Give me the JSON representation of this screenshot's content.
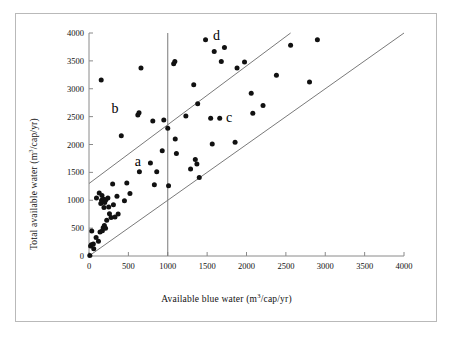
{
  "figure": {
    "background": "#ffffff",
    "frame_color": "#b9b9b9",
    "point_color": "#111111",
    "line_color": "#7a7a7a",
    "axis_color": "#8a8a8a"
  },
  "chart_data": {
    "type": "scatter",
    "title": "",
    "xlabel": "Available blue water (m3/cap/yr)",
    "ylabel": "Total available water (m3/cap/yr)",
    "xlabel_main": "Available blue water (m",
    "xlabel_sup": "3",
    "xlabel_tail": "/cap/yr)",
    "ylabel_main": "Total available water (m",
    "ylabel_sup": "3",
    "ylabel_tail": "/cap/yr)",
    "xlim": [
      0,
      4000
    ],
    "ylim": [
      0,
      4000
    ],
    "xticks": [
      0,
      500,
      1000,
      1500,
      2000,
      2500,
      3000,
      3500,
      4000
    ],
    "yticks": [
      0,
      500,
      1000,
      1500,
      2000,
      2500,
      3000,
      3500,
      4000
    ],
    "xtick_labels": [
      "0",
      "500",
      "1000",
      "1500",
      "2000",
      "2500",
      "3000",
      "3500",
      "4000"
    ],
    "ytick_labels": [
      "0",
      "500",
      "1000",
      "1500",
      "2000",
      "2500",
      "3000",
      "3500",
      "4000"
    ],
    "grid": false,
    "legend": "none",
    "marker": "filled-circle",
    "marker_size_px": 5,
    "reference_lines": [
      {
        "name": "vertical-threshold-1000",
        "type": "vertical",
        "x": 1000,
        "y_from": 0,
        "y_to": 4000
      },
      {
        "name": "upper-diagonal",
        "type": "line",
        "x_from": 0,
        "y_from": 1300,
        "x_to": 2560,
        "y_to": 4000
      },
      {
        "name": "lower-diagonal",
        "type": "line",
        "x_from": 0,
        "y_from": 0,
        "x_to": 4000,
        "y_to": 4000
      }
    ],
    "annotations": [
      {
        "label": "a",
        "x": 620,
        "y": 1680
      },
      {
        "label": "b",
        "x": 330,
        "y": 2640
      },
      {
        "label": "c",
        "x": 1780,
        "y": 2470
      },
      {
        "label": "d",
        "x": 1620,
        "y": 3950
      }
    ],
    "points": [
      {
        "x": 10,
        "y": 10
      },
      {
        "x": 20,
        "y": 180
      },
      {
        "x": 30,
        "y": 200
      },
      {
        "x": 35,
        "y": 450
      },
      {
        "x": 55,
        "y": 215
      },
      {
        "x": 60,
        "y": 130
      },
      {
        "x": 90,
        "y": 330
      },
      {
        "x": 95,
        "y": 1040
      },
      {
        "x": 120,
        "y": 265
      },
      {
        "x": 130,
        "y": 1130
      },
      {
        "x": 140,
        "y": 430
      },
      {
        "x": 150,
        "y": 940
      },
      {
        "x": 155,
        "y": 3155
      },
      {
        "x": 160,
        "y": 1000
      },
      {
        "x": 165,
        "y": 1085
      },
      {
        "x": 170,
        "y": 455
      },
      {
        "x": 180,
        "y": 505
      },
      {
        "x": 185,
        "y": 1020
      },
      {
        "x": 190,
        "y": 870
      },
      {
        "x": 195,
        "y": 545
      },
      {
        "x": 200,
        "y": 960
      },
      {
        "x": 210,
        "y": 500
      },
      {
        "x": 215,
        "y": 1010
      },
      {
        "x": 225,
        "y": 640
      },
      {
        "x": 240,
        "y": 1040
      },
      {
        "x": 250,
        "y": 880
      },
      {
        "x": 260,
        "y": 760
      },
      {
        "x": 280,
        "y": 690
      },
      {
        "x": 300,
        "y": 1290
      },
      {
        "x": 310,
        "y": 920
      },
      {
        "x": 330,
        "y": 700
      },
      {
        "x": 355,
        "y": 1070
      },
      {
        "x": 370,
        "y": 755
      },
      {
        "x": 410,
        "y": 2155
      },
      {
        "x": 450,
        "y": 990
      },
      {
        "x": 480,
        "y": 1310
      },
      {
        "x": 520,
        "y": 1120
      },
      {
        "x": 620,
        "y": 2530
      },
      {
        "x": 635,
        "y": 2570
      },
      {
        "x": 640,
        "y": 1510
      },
      {
        "x": 660,
        "y": 3370
      },
      {
        "x": 780,
        "y": 1670
      },
      {
        "x": 810,
        "y": 2420
      },
      {
        "x": 830,
        "y": 1280
      },
      {
        "x": 860,
        "y": 1510
      },
      {
        "x": 930,
        "y": 1890
      },
      {
        "x": 950,
        "y": 2440
      },
      {
        "x": 1000,
        "y": 2290
      },
      {
        "x": 1010,
        "y": 1260
      },
      {
        "x": 1075,
        "y": 3450
      },
      {
        "x": 1090,
        "y": 3490
      },
      {
        "x": 1095,
        "y": 2100
      },
      {
        "x": 1110,
        "y": 1840
      },
      {
        "x": 1230,
        "y": 2510
      },
      {
        "x": 1290,
        "y": 1560
      },
      {
        "x": 1330,
        "y": 3070
      },
      {
        "x": 1350,
        "y": 1730
      },
      {
        "x": 1370,
        "y": 1650
      },
      {
        "x": 1380,
        "y": 2730
      },
      {
        "x": 1400,
        "y": 1410
      },
      {
        "x": 1480,
        "y": 3880
      },
      {
        "x": 1545,
        "y": 2470
      },
      {
        "x": 1565,
        "y": 2010
      },
      {
        "x": 1590,
        "y": 3670
      },
      {
        "x": 1660,
        "y": 2470
      },
      {
        "x": 1680,
        "y": 3490
      },
      {
        "x": 1720,
        "y": 3740
      },
      {
        "x": 1855,
        "y": 2040
      },
      {
        "x": 1880,
        "y": 3370
      },
      {
        "x": 1975,
        "y": 3480
      },
      {
        "x": 2060,
        "y": 2920
      },
      {
        "x": 2080,
        "y": 2560
      },
      {
        "x": 2210,
        "y": 2700
      },
      {
        "x": 2380,
        "y": 3240
      },
      {
        "x": 2560,
        "y": 3780
      },
      {
        "x": 2800,
        "y": 3120
      },
      {
        "x": 2900,
        "y": 3880
      }
    ]
  }
}
